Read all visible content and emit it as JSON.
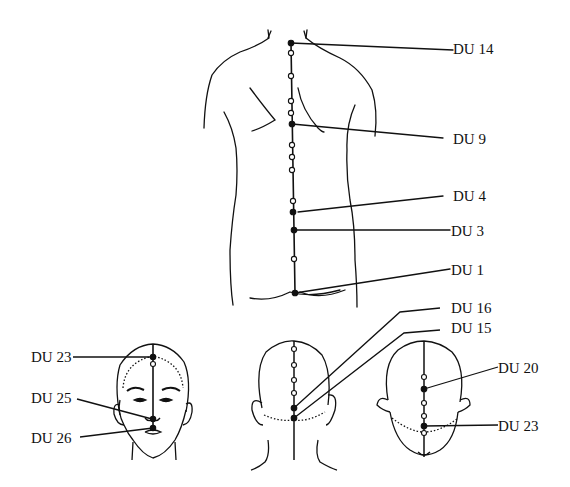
{
  "figure": {
    "colors": {
      "line": "#111111",
      "background": "#ffffff"
    },
    "back_view": {
      "labels": [
        {
          "id": "du14",
          "text": "DU 14"
        },
        {
          "id": "du9",
          "text": "DU 9"
        },
        {
          "id": "du4",
          "text": "DU 4"
        },
        {
          "id": "du3",
          "text": "DU 3"
        },
        {
          "id": "du1",
          "text": "DU 1"
        }
      ]
    },
    "face_view": {
      "labels": [
        {
          "id": "du23",
          "text": "DU 23"
        },
        {
          "id": "du25",
          "text": "DU 25"
        },
        {
          "id": "du26",
          "text": "DU 26"
        }
      ]
    },
    "head_back_view": {
      "labels": [
        {
          "id": "du16",
          "text": "DU 16"
        },
        {
          "id": "du15",
          "text": "DU 15"
        }
      ]
    },
    "head_top_view": {
      "labels": [
        {
          "id": "du20",
          "text": "DU 20"
        },
        {
          "id": "du23b",
          "text": "DU 23"
        }
      ]
    }
  }
}
